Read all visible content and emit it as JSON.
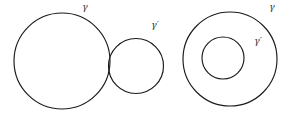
{
  "figure": {
    "background_color": "#ffffff",
    "stroke_color": "#1a1a1a",
    "label_color": "#2b2b2b",
    "width": 288,
    "height": 116,
    "panels": [
      {
        "id": "external-tangency",
        "description": "Two externally tangent circles",
        "circles": [
          {
            "name": "gamma",
            "label": "γ",
            "cx": 62,
            "cy": 61,
            "r": 48
          },
          {
            "name": "gamma-prime",
            "label": "γ′",
            "cx": 136,
            "cy": 66,
            "r": 27.5
          }
        ],
        "labels": [
          {
            "name": "gamma",
            "text": "γ",
            "x": 85,
            "y": 7
          },
          {
            "name": "gamma-prime",
            "text": "γ′",
            "x": 155,
            "y": 25
          }
        ]
      },
      {
        "id": "internal-tangency",
        "description": "Two internally tangent circles",
        "circles": [
          {
            "name": "gamma",
            "label": "γ",
            "cx": 230,
            "cy": 59,
            "r": 47
          },
          {
            "name": "gamma-prime",
            "label": "γ′",
            "cx": 223,
            "cy": 58,
            "r": 21
          }
        ],
        "labels": [
          {
            "name": "gamma",
            "text": "γ",
            "x": 272,
            "y": 7
          },
          {
            "name": "gamma-prime",
            "text": "γ′",
            "x": 258,
            "y": 41
          }
        ]
      }
    ]
  }
}
